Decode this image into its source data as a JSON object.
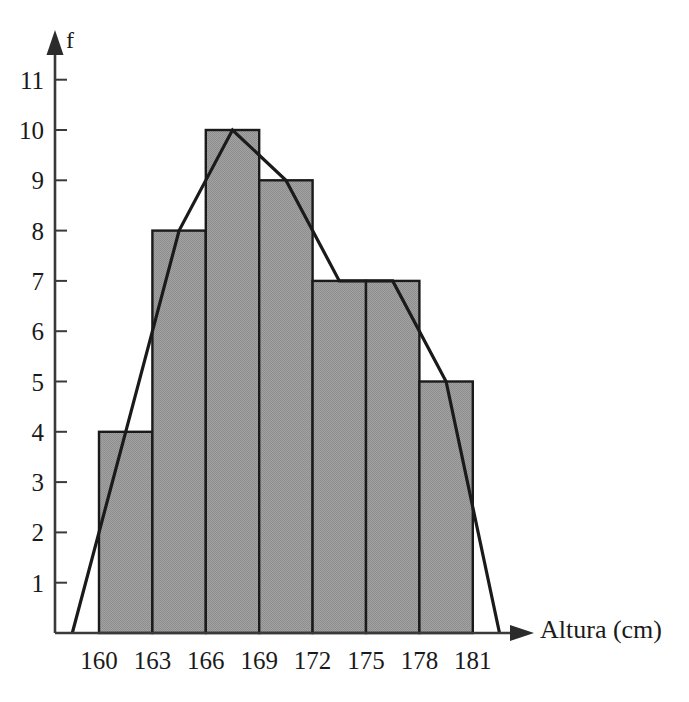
{
  "chart_data": {
    "type": "bar",
    "title": "",
    "subtitle": "",
    "xlabel": "Altura (cm)",
    "ylabel": "f",
    "categories": [
      "160-163",
      "163-166",
      "166-169",
      "169-172",
      "172-175",
      "175-178",
      "178-181"
    ],
    "bin_edges": [
      160,
      163,
      166,
      169,
      172,
      175,
      178,
      181
    ],
    "values": [
      4,
      8,
      10,
      9,
      7,
      7,
      5
    ],
    "series": [
      {
        "name": "Frecuencia (histograma)",
        "values": [
          4,
          8,
          10,
          9,
          7,
          7,
          5
        ]
      },
      {
        "name": "Poligono de frecuencias",
        "type": "line",
        "x": [
          158.5,
          161.5,
          164.5,
          167.5,
          170.5,
          173.5,
          176.5,
          179.5,
          182.5
        ],
        "values": [
          0,
          4,
          8,
          10,
          9,
          7,
          7,
          5,
          0
        ]
      }
    ],
    "x_tick_labels": [
      "160",
      "163",
      "166",
      "169",
      "172",
      "175",
      "178",
      "181"
    ],
    "y_tick_labels": [
      "1",
      "2",
      "3",
      "4",
      "5",
      "6",
      "7",
      "8",
      "9",
      "10",
      "11"
    ],
    "y_ticks": [
      1,
      2,
      3,
      4,
      5,
      6,
      7,
      8,
      9,
      10,
      11
    ],
    "ylim": [
      0,
      11.8
    ],
    "xlim": [
      158.5,
      182.5
    ],
    "grid": false,
    "legend": "none",
    "bar_fill_color": "#9a9a9a",
    "bar_edge_color": "#1a1a1a",
    "polygon_line_color": "#1a1a1a",
    "axis_color": "#3a3a3a"
  },
  "axes": {
    "y_arrow": "up-arrow",
    "x_arrow": "right-arrow",
    "y_title": "f",
    "x_title": "Altura (cm)"
  }
}
